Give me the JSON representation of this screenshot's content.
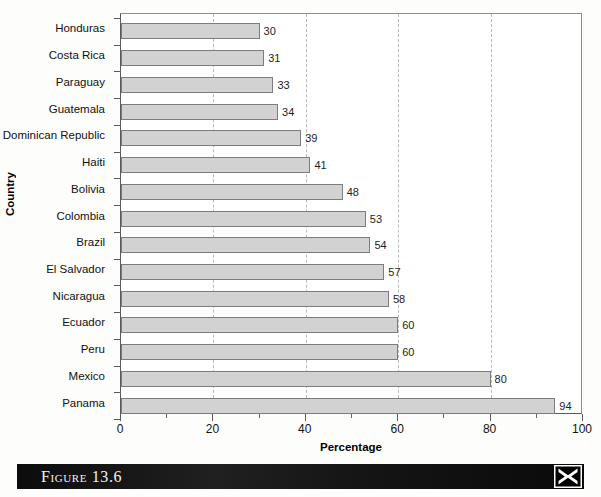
{
  "figure": {
    "caption": "Figure 13.6",
    "logo_icon": "x-logo-icon"
  },
  "chart_data": {
    "type": "bar",
    "orientation": "horizontal",
    "title": "",
    "xlabel": "Percentage",
    "ylabel": "Country",
    "xlim": [
      0,
      100
    ],
    "xticks": [
      0,
      20,
      40,
      60,
      80,
      100
    ],
    "xtick_labels": [
      "0",
      "20",
      "40",
      "60",
      "80",
      "100"
    ],
    "minor_xticks": [
      10,
      30,
      50,
      70,
      90
    ],
    "grid": "vertical-dashed-major",
    "legend": null,
    "bar_fill": "#d2d2d2",
    "bar_edge": "#7c7c7c",
    "categories": [
      "Honduras",
      "Costa Rica",
      "Paraguay",
      "Guatemala",
      "Dominican Republic",
      "Haiti",
      "Bolivia",
      "Colombia",
      "Brazil",
      "El Salvador",
      "Nicaragua",
      "Ecuador",
      "Peru",
      "Mexico",
      "Panama"
    ],
    "values": [
      30,
      31,
      33,
      34,
      39,
      41,
      48,
      53,
      54,
      57,
      58,
      60,
      60,
      80,
      94
    ],
    "value_labels": [
      "30",
      "31",
      "33",
      "34",
      "39",
      "41",
      "48",
      "53",
      "54",
      "57",
      "58",
      "60",
      "60",
      "80",
      "94"
    ]
  }
}
